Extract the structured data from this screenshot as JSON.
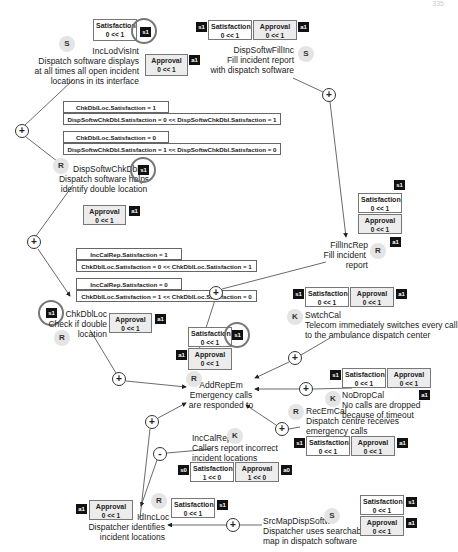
{
  "page_number": "335",
  "goals": {
    "IncLodVisInt": {
      "badge": "S",
      "name": "IncLodVisInt",
      "desc": [
        "Dispatch software displays",
        "at all times all open incident",
        "locations in its interface"
      ]
    },
    "DispSoftwFillInc": {
      "badge": "S",
      "name": "DispSoftwFillInc",
      "desc": [
        "Fill incident report",
        "with dispatch software"
      ]
    },
    "DispSoftwChkDbl": {
      "badge": "R",
      "name": "DispSoftwChkDbl",
      "desc": [
        "Dispatch software helps",
        "identify double location"
      ]
    },
    "FillIncRep": {
      "badge": "R",
      "name": "FillIncRep",
      "desc": [
        "Fill incident",
        "report"
      ]
    },
    "ChkDblLoc": {
      "badge": "R",
      "name": "ChkDblLoc",
      "desc": [
        "Check if double",
        "location"
      ]
    },
    "SwtchCal": {
      "badge": "K",
      "name": "SwtchCal",
      "desc": [
        "Telecom immediately switches every call",
        "to the ambulance dispatch center"
      ]
    },
    "AddRepEm": {
      "badge": "R",
      "name": "AddRepEm",
      "desc": [
        "Emergency calls",
        "are responded to"
      ]
    },
    "NoDropCal": {
      "badge": "K",
      "name": "NoDropCal",
      "desc": [
        "No calls are dropped",
        "because of timeout"
      ]
    },
    "RecEmCal": {
      "badge": "R",
      "name": "RecEmCal",
      "desc": [
        "Dispatch centre receives",
        "emergency calls"
      ]
    },
    "IncCalRep": {
      "badge": "K",
      "name": "IncCalRep",
      "desc": [
        "Callers report incorrect",
        "incident locations"
      ]
    },
    "IdIncLoc": {
      "badge": "R",
      "name": "IdIncLoc",
      "desc": [
        "Dispatcher identifies",
        "incident locations"
      ]
    },
    "SrcMapDispSoftw": {
      "badge": "S",
      "name": "SrcMapDispSoftw",
      "desc": [
        "Dispatcher uses searchable",
        "map in dispatch software"
      ]
    }
  },
  "attributes": {
    "sat": "Satisfaction",
    "app": "Approval",
    "v01": "0 << 1",
    "v10": "1 << 0",
    "s1": "s1",
    "a1": "a1",
    "s0": "s0",
    "a0": "a0"
  },
  "conditions": {
    "c1a": "ChkDblLoc.Satisfaction = 1",
    "c1b": "DispSoftwChkDbl.Satisfaction = 0 << DispSoftwChkDbl.Satisfaction = 1",
    "c2a": "ChkDblLoc.Satisfaction = 0",
    "c2b": "DispSoftwChkDbl.Satisfaction = 1 << DispSoftwChkDbl.Satisfaction = 0",
    "c3a": "IncCalRep.Satisfaction = 1",
    "c3b": "ChkDblLoc.Satisfaction = 0 << ChkDblLoc.Satisfaction = 1",
    "c4a": "IncCalRep.Satisfaction = 0",
    "c4b": "ChkDblLoc.Satisfaction = 1 << ChkDblLoc.Satisfaction = 0"
  },
  "operators": {
    "plus": "+",
    "minus": "-"
  }
}
